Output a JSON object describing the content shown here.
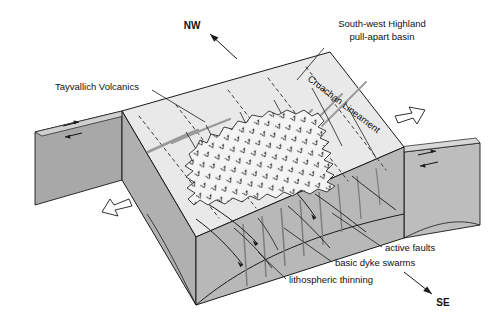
{
  "figure": {
    "type": "geological-block-diagram",
    "title_visible": false
  },
  "compass": {
    "nw": "NW",
    "se": "SE"
  },
  "labels": {
    "tayvallich": "Tayvallich Volcanics",
    "basin_line1": "South-west Highland",
    "basin_line2": "pull-apart basin",
    "lineament": "Cruachan Lineament",
    "active_faults": "active faults",
    "dyke_swarms": "basic dyke swarms",
    "lithospheric_thinning": "lithospheric thinning"
  },
  "icons": {
    "extension_arrow_ne": "hollow-arrow-ne-icon",
    "extension_arrow_sw": "hollow-arrow-sw-icon",
    "compass_arrow_nw": "arrow-nw-icon",
    "compass_arrow_se": "arrow-se-icon",
    "strike_slip_left": "strike-slip-arrow-pair-icon",
    "strike_slip_right": "strike-slip-arrow-pair-icon",
    "volcanic_ornament": "volcanic-v-ornament-icon"
  },
  "colors": {
    "top_surface": "#e9e9e9",
    "basin_surface": "#e2e2e2",
    "front_face": "#b0b0b0",
    "left_face": "#a8a8a8",
    "right_face": "#bdbdbd",
    "side_block_top": "#d8d8d8",
    "volcanics_fill": "#f2f2f2",
    "line": "#1a1a1a",
    "dyke_gray": "#8d8d8d",
    "dash": "#4a4a4a",
    "background": "#ffffff"
  }
}
